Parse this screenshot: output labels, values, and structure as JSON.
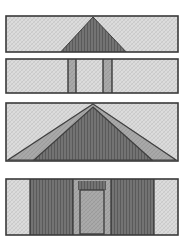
{
  "figure": {
    "title": "",
    "kind": "architectural-elevation-sections",
    "width": 187,
    "height": 245,
    "background": "#ffffff",
    "panel_count": 4,
    "stroke_color": "#3a3a3a",
    "stroke_width": 1.4,
    "palette": {
      "paper_white": "#ffffff",
      "fill_light": "#d9d9d9",
      "fill_light_hatch": "#cfcfcf",
      "fill_medium": "#a8a8a8",
      "fill_medium_hatch": "#9c9c9c",
      "fill_dark": "#6e6e6e",
      "fill_dark_hatch": "#5e5e5e",
      "fill_darker": "#585858",
      "outline": "#3a3a3a",
      "outline_soft": "#4a4a4a"
    },
    "panels": [
      {
        "index": 0,
        "name": "gable-roof-section",
        "label": "",
        "x": 6,
        "y": 16,
        "width": 172,
        "height": 36,
        "ground_fill": "fill_light",
        "shapes": [
          {
            "name": "gable-triangle",
            "type": "triangle",
            "fill": "fill_dark",
            "apex_x": 93,
            "apex_y": 17,
            "left_x": 57,
            "right_x": 130,
            "base_y": 56
          }
        ]
      },
      {
        "index": 1,
        "name": "wall-section-with-piers",
        "label": "",
        "x": 6,
        "y": 59,
        "width": 172,
        "height": 34,
        "ground_fill": "fill_light",
        "shapes": [
          {
            "name": "pier-left",
            "type": "vertical-band",
            "fill": "fill_medium",
            "x": 68,
            "width": 8
          },
          {
            "name": "bay-center",
            "type": "vertical-band",
            "fill": "fill_light",
            "x": 76,
            "width": 27
          },
          {
            "name": "pier-right",
            "type": "vertical-band",
            "fill": "fill_medium",
            "x": 103,
            "width": 9
          }
        ]
      },
      {
        "index": 2,
        "name": "layered-gable-roof",
        "label": "",
        "x": 6,
        "y": 103,
        "width": 172,
        "height": 58,
        "ground_fill": "fill_light",
        "shapes": [
          {
            "name": "roof-outer-layer",
            "type": "triangle",
            "fill": "fill_medium",
            "apex_x": 93,
            "apex_y": 104,
            "left_x": 8,
            "right_x": 176,
            "base_y": 160
          },
          {
            "name": "roof-inner-layer",
            "type": "triangle",
            "fill": "fill_dark",
            "apex_x": 93,
            "apex_y": 107,
            "left_x": 34,
            "right_x": 152,
            "base_y": 160
          }
        ]
      },
      {
        "index": 3,
        "name": "facade-with-doorway",
        "label": "",
        "x": 6,
        "y": 179,
        "width": 172,
        "height": 56,
        "ground_fill": "fill_light",
        "shapes": [
          {
            "name": "wall-left-light",
            "type": "vertical-band",
            "fill": "fill_light",
            "x": 8,
            "width": 22
          },
          {
            "name": "wall-left-dark",
            "type": "vertical-band",
            "fill": "fill_dark",
            "x": 30,
            "width": 43
          },
          {
            "name": "doorway-reveal",
            "type": "vertical-band",
            "fill": "fill_medium",
            "x": 73,
            "width": 38
          },
          {
            "name": "wall-right-dark",
            "type": "vertical-band",
            "fill": "fill_dark",
            "x": 111,
            "width": 43
          },
          {
            "name": "wall-right-light",
            "type": "vertical-band",
            "fill": "fill_light",
            "x": 154,
            "width": 22
          },
          {
            "name": "door-panel",
            "type": "rect",
            "fill": "fill_medium",
            "x": 80,
            "y": 190,
            "width": 24,
            "height": 44
          },
          {
            "name": "door-lintel",
            "type": "rect",
            "fill": "fill_dark",
            "x": 78,
            "y": 181,
            "width": 28,
            "height": 9
          }
        ]
      }
    ]
  }
}
